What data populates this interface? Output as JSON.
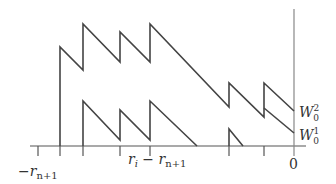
{
  "colors": {
    "stroke": "#444444",
    "axis": "#555555",
    "vline": "#888888",
    "text": "#333333",
    "background": "#ffffff"
  },
  "labels": {
    "left_tick": {
      "base": "−r",
      "sub": "n+1"
    },
    "mid_tick": {
      "a": "r",
      "a_sub": "i",
      "minus": " − r",
      "b_sub": "n+1"
    },
    "zero": "0",
    "upper_curve": {
      "base": "W",
      "sub": "0",
      "sup": "2"
    },
    "lower_curve": {
      "base": "W",
      "sub": "0",
      "sup": "1"
    }
  },
  "geometry": {
    "baseline_y": 146,
    "axis_x": [
      30,
      306
    ],
    "zero_line": {
      "x": 294,
      "y1": 9,
      "y2": 156
    },
    "ticks_x": [
      38,
      60,
      83,
      120,
      150,
      229,
      264
    ],
    "tick_y2": 156,
    "upper_path": "M60,146 L60,47 L83,70 L83,24 L120,62 L120,32 L150,62 L150,24 L229,107 L229,83 L264,117 L264,83 L294,111",
    "lower_path": "M83,146 L83,101 L120,140 L120,110 L150,140 L150,101 L197,146",
    "lower_spike": "M229,146 L229,129 L243,146",
    "lower_tail": "M264,108 L294,133"
  }
}
